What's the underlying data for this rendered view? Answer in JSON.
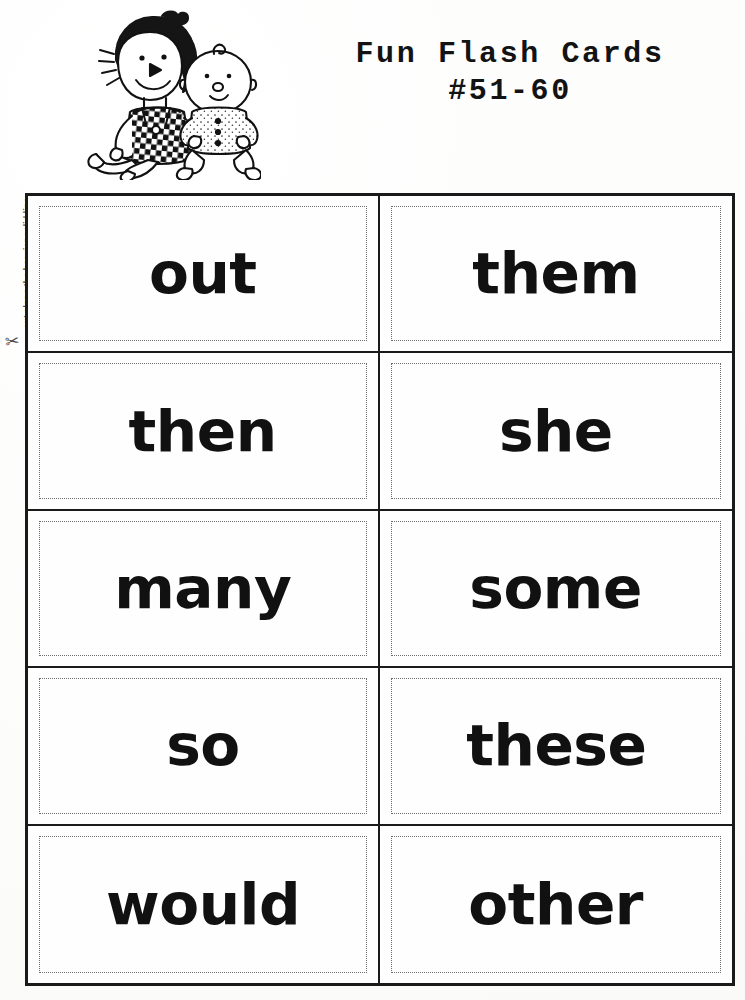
{
  "document": {
    "title_line1": "Fun Flash Cards",
    "title_line2": "#51-60",
    "cut_instruction": "cut along the heavier solid line",
    "scissors_icon": "✂"
  },
  "illustration": {
    "name": "girl-with-baby-doll-clipart",
    "description": "line drawing of a girl in a checkered dress sitting beside a baby"
  },
  "cards": [
    {
      "row": 1,
      "col": 1,
      "word": "out"
    },
    {
      "row": 1,
      "col": 2,
      "word": "them"
    },
    {
      "row": 2,
      "col": 1,
      "word": "then"
    },
    {
      "row": 2,
      "col": 2,
      "word": "she"
    },
    {
      "row": 3,
      "col": 1,
      "word": "many"
    },
    {
      "row": 3,
      "col": 2,
      "word": "some"
    },
    {
      "row": 4,
      "col": 1,
      "word": "so"
    },
    {
      "row": 4,
      "col": 2,
      "word": "these"
    },
    {
      "row": 5,
      "col": 1,
      "word": "would"
    },
    {
      "row": 5,
      "col": 2,
      "word": "other"
    }
  ],
  "colors": {
    "ink": "#111111",
    "paper": "#fdfdfc",
    "border": "#1a1a1a",
    "dotted_border": "#6d6d6d"
  }
}
